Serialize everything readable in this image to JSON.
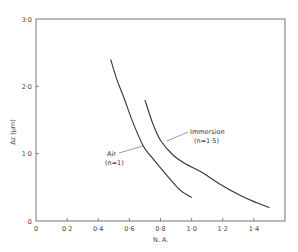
{
  "chart_data": {
    "type": "line",
    "title": "",
    "xlabel": "N. A.",
    "ylabel": "Δz (μm)",
    "xlim": [
      0,
      1.6
    ],
    "ylim": [
      0,
      3.0
    ],
    "grid": false,
    "legend": "none (inline annotations)",
    "x_ticks": [
      0,
      0.2,
      0.4,
      0.6,
      0.8,
      1.0,
      1.2,
      1.4
    ],
    "x_tick_labels": [
      "0",
      "0·2",
      "0·4",
      "0·6",
      "0·8",
      "1·0",
      "1·2",
      "1·4"
    ],
    "y_ticks": [
      0,
      1.0,
      2.0,
      3.0
    ],
    "y_tick_labels": [
      "0",
      "1·0",
      "2·0",
      "3·0"
    ],
    "series": [
      {
        "name": "Air (n=1)",
        "label_line1": "Air",
        "label_line2": "(n=1)",
        "x": [
          0.48,
          0.52,
          0.57,
          0.62,
          0.69,
          0.75,
          0.8,
          0.87,
          0.93,
          1.0
        ],
        "y": [
          2.4,
          2.1,
          1.8,
          1.48,
          1.11,
          0.93,
          0.79,
          0.6,
          0.45,
          0.35
        ]
      },
      {
        "name": "Immersion (n=1·5)",
        "label_line1": "Immersion",
        "label_line2": "(n=1·5)",
        "x": [
          0.7,
          0.75,
          0.8,
          0.88,
          0.96,
          1.06,
          1.18,
          1.32,
          1.42,
          1.5
        ],
        "y": [
          1.8,
          1.45,
          1.2,
          0.98,
          0.85,
          0.73,
          0.55,
          0.37,
          0.27,
          0.2
        ]
      }
    ],
    "annotations": [
      {
        "text": "Air",
        "sub": "(n=1)",
        "points_to_series": "Air (n=1)"
      },
      {
        "text": "Immersion",
        "sub": "(n=1·5)",
        "points_to_series": "Immersion (n=1·5)"
      }
    ]
  }
}
